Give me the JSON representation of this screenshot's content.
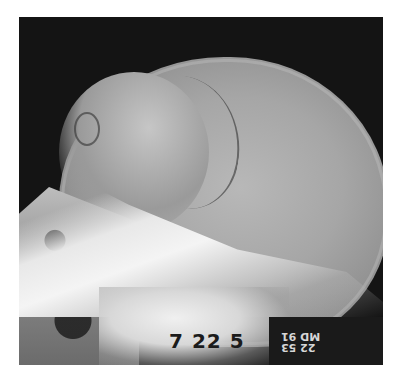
{
  "image": {
    "subject": "lateral skull radiograph",
    "stamp": {
      "date_text": "7 22 5",
      "mirrored_top": "22 53",
      "mirrored_bottom": "MD 91"
    },
    "colors": {
      "background": "#ffffff",
      "film_dark": "#141414",
      "bone_bright": "#f0f0f0",
      "vault_gray": "#a6a6a6"
    }
  }
}
